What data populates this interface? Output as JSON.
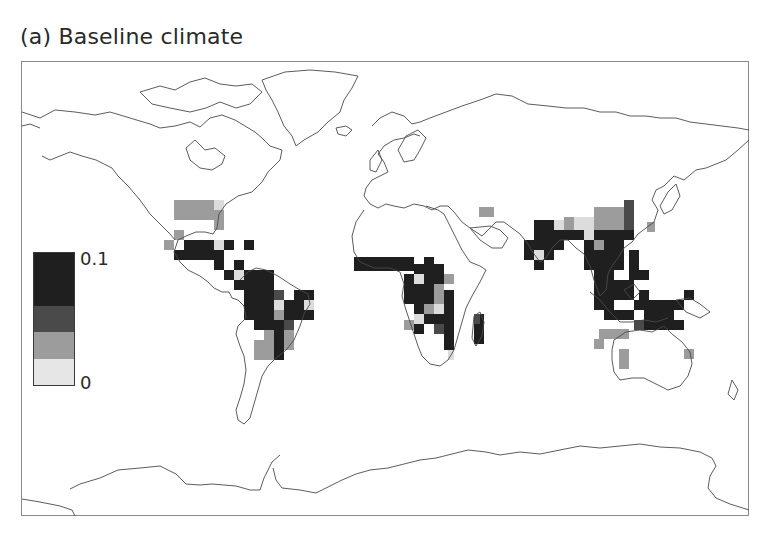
{
  "figure": {
    "title": "(a) Baseline climate",
    "panel_label": "(a)"
  },
  "legend": {
    "max_label": "0.1",
    "min_label": "0",
    "bins": [
      {
        "name": "high",
        "color": "#1f1f1f",
        "weight": 50
      },
      {
        "name": "mid-high",
        "color": "#4a4a4a",
        "weight": 25
      },
      {
        "name": "mid-low",
        "color": "#9c9c9c",
        "weight": 25
      },
      {
        "name": "low",
        "color": "#e6e6e6",
        "weight": 25
      }
    ]
  },
  "map": {
    "projection": "equirectangular world",
    "frame": {
      "x": 21,
      "y": 61,
      "width": 728,
      "height": 455
    },
    "cell_size": 10,
    "palette": {
      "d": "#1f1f1f",
      "m": "#4a4a4a",
      "g": "#9c9c9c",
      "l": "#dcdcdc"
    },
    "cells": [
      {
        "x": 174,
        "y": 200,
        "w": 40,
        "h": 20,
        "c": "g"
      },
      {
        "x": 214,
        "y": 200,
        "w": 10,
        "h": 10,
        "c": "l"
      },
      {
        "x": 214,
        "y": 210,
        "w": 10,
        "h": 20,
        "c": "g"
      },
      {
        "x": 174,
        "y": 230,
        "w": 10,
        "h": 10,
        "c": "g"
      },
      {
        "x": 164,
        "y": 240,
        "w": 10,
        "h": 10,
        "c": "g"
      },
      {
        "x": 184,
        "y": 240,
        "w": 30,
        "h": 10,
        "c": "d"
      },
      {
        "x": 224,
        "y": 240,
        "w": 10,
        "h": 10,
        "c": "d"
      },
      {
        "x": 244,
        "y": 240,
        "w": 10,
        "h": 10,
        "c": "d"
      },
      {
        "x": 174,
        "y": 250,
        "w": 50,
        "h": 10,
        "c": "d"
      },
      {
        "x": 214,
        "y": 240,
        "w": 10,
        "h": 10,
        "c": "l"
      },
      {
        "x": 214,
        "y": 260,
        "w": 10,
        "h": 10,
        "c": "d"
      },
      {
        "x": 234,
        "y": 260,
        "w": 10,
        "h": 10,
        "c": "d"
      },
      {
        "x": 224,
        "y": 270,
        "w": 10,
        "h": 10,
        "c": "d"
      },
      {
        "x": 234,
        "y": 270,
        "w": 10,
        "h": 10,
        "c": "l"
      },
      {
        "x": 244,
        "y": 270,
        "w": 30,
        "h": 10,
        "c": "d"
      },
      {
        "x": 234,
        "y": 280,
        "w": 40,
        "h": 10,
        "c": "d"
      },
      {
        "x": 244,
        "y": 290,
        "w": 40,
        "h": 10,
        "c": "d"
      },
      {
        "x": 274,
        "y": 290,
        "w": 10,
        "h": 10,
        "c": "m"
      },
      {
        "x": 244,
        "y": 300,
        "w": 30,
        "h": 20,
        "c": "d"
      },
      {
        "x": 274,
        "y": 300,
        "w": 10,
        "h": 10,
        "c": "l"
      },
      {
        "x": 274,
        "y": 310,
        "w": 10,
        "h": 10,
        "c": "g"
      },
      {
        "x": 284,
        "y": 300,
        "w": 10,
        "h": 20,
        "c": "d"
      },
      {
        "x": 294,
        "y": 290,
        "w": 20,
        "h": 10,
        "c": "d"
      },
      {
        "x": 294,
        "y": 300,
        "w": 10,
        "h": 10,
        "c": "d"
      },
      {
        "x": 304,
        "y": 300,
        "w": 10,
        "h": 10,
        "c": "l"
      },
      {
        "x": 294,
        "y": 310,
        "w": 20,
        "h": 10,
        "c": "d"
      },
      {
        "x": 254,
        "y": 320,
        "w": 30,
        "h": 10,
        "c": "d"
      },
      {
        "x": 284,
        "y": 320,
        "w": 10,
        "h": 10,
        "c": "m"
      },
      {
        "x": 264,
        "y": 330,
        "w": 10,
        "h": 10,
        "c": "g"
      },
      {
        "x": 274,
        "y": 330,
        "w": 10,
        "h": 20,
        "c": "d"
      },
      {
        "x": 284,
        "y": 330,
        "w": 10,
        "h": 10,
        "c": "g"
      },
      {
        "x": 254,
        "y": 340,
        "w": 20,
        "h": 10,
        "c": "g"
      },
      {
        "x": 274,
        "y": 350,
        "w": 10,
        "h": 10,
        "c": "d"
      },
      {
        "x": 254,
        "y": 350,
        "w": 20,
        "h": 10,
        "c": "g"
      },
      {
        "x": 284,
        "y": 340,
        "w": 10,
        "h": 10,
        "c": "g"
      },
      {
        "x": 354,
        "y": 257,
        "w": 60,
        "h": 14,
        "c": "d"
      },
      {
        "x": 424,
        "y": 257,
        "w": 10,
        "h": 14,
        "c": "d"
      },
      {
        "x": 414,
        "y": 264,
        "w": 30,
        "h": 10,
        "c": "d"
      },
      {
        "x": 404,
        "y": 274,
        "w": 20,
        "h": 10,
        "c": "d"
      },
      {
        "x": 414,
        "y": 274,
        "w": 10,
        "h": 10,
        "c": "l"
      },
      {
        "x": 424,
        "y": 274,
        "w": 20,
        "h": 10,
        "c": "d"
      },
      {
        "x": 444,
        "y": 274,
        "w": 10,
        "h": 10,
        "c": "g"
      },
      {
        "x": 404,
        "y": 284,
        "w": 30,
        "h": 20,
        "c": "d"
      },
      {
        "x": 434,
        "y": 284,
        "w": 10,
        "h": 20,
        "c": "g"
      },
      {
        "x": 444,
        "y": 290,
        "w": 10,
        "h": 20,
        "c": "d"
      },
      {
        "x": 414,
        "y": 304,
        "w": 20,
        "h": 10,
        "c": "d"
      },
      {
        "x": 424,
        "y": 304,
        "w": 10,
        "h": 10,
        "c": "g"
      },
      {
        "x": 434,
        "y": 304,
        "w": 10,
        "h": 10,
        "c": "l"
      },
      {
        "x": 414,
        "y": 314,
        "w": 10,
        "h": 10,
        "c": "l"
      },
      {
        "x": 424,
        "y": 314,
        "w": 20,
        "h": 10,
        "c": "d"
      },
      {
        "x": 444,
        "y": 310,
        "w": 10,
        "h": 20,
        "c": "d"
      },
      {
        "x": 404,
        "y": 320,
        "w": 10,
        "h": 10,
        "c": "g"
      },
      {
        "x": 414,
        "y": 324,
        "w": 10,
        "h": 10,
        "c": "d"
      },
      {
        "x": 434,
        "y": 324,
        "w": 10,
        "h": 10,
        "c": "m"
      },
      {
        "x": 444,
        "y": 330,
        "w": 10,
        "h": 20,
        "c": "d"
      },
      {
        "x": 474,
        "y": 314,
        "w": 10,
        "h": 30,
        "c": "d"
      },
      {
        "x": 474,
        "y": 314,
        "w": 6,
        "h": 10,
        "c": "m"
      },
      {
        "x": 448,
        "y": 350,
        "w": 6,
        "h": 10,
        "c": "l"
      },
      {
        "x": 479,
        "y": 207,
        "w": 15,
        "h": 10,
        "c": "g"
      },
      {
        "x": 534,
        "y": 220,
        "w": 20,
        "h": 10,
        "c": "d"
      },
      {
        "x": 554,
        "y": 220,
        "w": 10,
        "h": 10,
        "c": "l"
      },
      {
        "x": 564,
        "y": 217,
        "w": 10,
        "h": 13,
        "c": "g"
      },
      {
        "x": 574,
        "y": 217,
        "w": 20,
        "h": 13,
        "c": "l"
      },
      {
        "x": 594,
        "y": 207,
        "w": 30,
        "h": 23,
        "c": "g"
      },
      {
        "x": 624,
        "y": 200,
        "w": 10,
        "h": 30,
        "c": "m"
      },
      {
        "x": 534,
        "y": 230,
        "w": 30,
        "h": 10,
        "c": "d"
      },
      {
        "x": 564,
        "y": 230,
        "w": 20,
        "h": 10,
        "c": "d"
      },
      {
        "x": 584,
        "y": 230,
        "w": 10,
        "h": 10,
        "c": "l"
      },
      {
        "x": 594,
        "y": 230,
        "w": 40,
        "h": 10,
        "c": "d"
      },
      {
        "x": 524,
        "y": 240,
        "w": 40,
        "h": 10,
        "c": "d"
      },
      {
        "x": 534,
        "y": 250,
        "w": 10,
        "h": 10,
        "c": "l"
      },
      {
        "x": 524,
        "y": 250,
        "w": 10,
        "h": 10,
        "c": "d"
      },
      {
        "x": 544,
        "y": 250,
        "w": 10,
        "h": 10,
        "c": "d"
      },
      {
        "x": 534,
        "y": 260,
        "w": 10,
        "h": 10,
        "c": "d"
      },
      {
        "x": 584,
        "y": 240,
        "w": 20,
        "h": 10,
        "c": "d"
      },
      {
        "x": 594,
        "y": 240,
        "w": 10,
        "h": 10,
        "c": "g"
      },
      {
        "x": 604,
        "y": 240,
        "w": 20,
        "h": 10,
        "c": "d"
      },
      {
        "x": 584,
        "y": 250,
        "w": 40,
        "h": 20,
        "c": "d"
      },
      {
        "x": 594,
        "y": 270,
        "w": 20,
        "h": 40,
        "c": "d"
      },
      {
        "x": 604,
        "y": 310,
        "w": 20,
        "h": 10,
        "c": "d"
      },
      {
        "x": 629,
        "y": 250,
        "w": 10,
        "h": 30,
        "c": "d"
      },
      {
        "x": 639,
        "y": 270,
        "w": 10,
        "h": 10,
        "c": "d"
      },
      {
        "x": 614,
        "y": 280,
        "w": 20,
        "h": 20,
        "c": "d"
      },
      {
        "x": 639,
        "y": 290,
        "w": 10,
        "h": 10,
        "c": "d"
      },
      {
        "x": 634,
        "y": 300,
        "w": 20,
        "h": 10,
        "c": "d"
      },
      {
        "x": 624,
        "y": 310,
        "w": 10,
        "h": 10,
        "c": "d"
      },
      {
        "x": 644,
        "y": 310,
        "w": 10,
        "h": 10,
        "c": "d"
      },
      {
        "x": 654,
        "y": 300,
        "w": 20,
        "h": 20,
        "c": "d"
      },
      {
        "x": 664,
        "y": 310,
        "w": 10,
        "h": 20,
        "c": "d"
      },
      {
        "x": 674,
        "y": 300,
        "w": 10,
        "h": 10,
        "c": "d"
      },
      {
        "x": 684,
        "y": 290,
        "w": 10,
        "h": 10,
        "c": "d"
      },
      {
        "x": 674,
        "y": 320,
        "w": 10,
        "h": 10,
        "c": "d"
      },
      {
        "x": 654,
        "y": 320,
        "w": 10,
        "h": 10,
        "c": "d"
      },
      {
        "x": 644,
        "y": 320,
        "w": 30,
        "h": 10,
        "c": "d"
      },
      {
        "x": 654,
        "y": 310,
        "w": 10,
        "h": 10,
        "c": "d"
      },
      {
        "x": 634,
        "y": 320,
        "w": 10,
        "h": 10,
        "c": "m"
      },
      {
        "x": 619,
        "y": 329,
        "w": 10,
        "h": 10,
        "c": "g"
      },
      {
        "x": 599,
        "y": 329,
        "w": 20,
        "h": 10,
        "c": "g"
      },
      {
        "x": 594,
        "y": 339,
        "w": 10,
        "h": 10,
        "c": "g"
      },
      {
        "x": 619,
        "y": 349,
        "w": 10,
        "h": 20,
        "c": "g"
      },
      {
        "x": 684,
        "y": 349,
        "w": 10,
        "h": 10,
        "c": "g"
      },
      {
        "x": 647,
        "y": 222,
        "w": 8,
        "h": 10,
        "c": "g"
      }
    ]
  },
  "chart_data": {
    "type": "heatmap",
    "title": "(a) Baseline climate",
    "xlabel": "",
    "ylabel": "",
    "colorbar": {
      "min": 0,
      "max": 0.1,
      "tick_labels": [
        "0",
        "0.1"
      ],
      "levels": 4,
      "colors": [
        "#e6e6e6",
        "#9c9c9c",
        "#4a4a4a",
        "#1f1f1f"
      ]
    },
    "regions": [
      {
        "region": "Southeastern United States",
        "level": "low-to-mid"
      },
      {
        "region": "Central America & Caribbean",
        "level": "high"
      },
      {
        "region": "Amazon basin / northern South America",
        "level": "high"
      },
      {
        "region": "Eastern Brazil",
        "level": "mid-to-low"
      },
      {
        "region": "West & Central Africa (Sahel to Congo)",
        "level": "high"
      },
      {
        "region": "East & Southern Africa",
        "level": "mixed"
      },
      {
        "region": "Madagascar",
        "level": "high"
      },
      {
        "region": "Middle East (Iraq/Iran)",
        "level": "mid-low"
      },
      {
        "region": "India & Southeast Asia",
        "level": "high"
      },
      {
        "region": "Southern/Eastern China",
        "level": "mid-low"
      },
      {
        "region": "Indonesia & New Guinea",
        "level": "high"
      },
      {
        "region": "Northern & Western Australia",
        "level": "mid-low"
      }
    ],
    "grid": false,
    "legend_position": "left"
  }
}
